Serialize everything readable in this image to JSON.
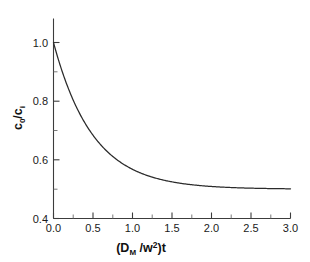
{
  "chart_data": {
    "type": "line",
    "title": "",
    "subtitle": "",
    "xlabel": "(D_M /w^2)t",
    "xlabel_parts": {
      "open_paren": "(D",
      "sub": "M",
      "mid": " /w",
      "sup": "2",
      "close": ")t"
    },
    "ylabel": "c_0/c_i",
    "ylabel_parts": {
      "numerator": "c",
      "numerator_sub": "0",
      "slash": "/c",
      "denominator_sub": "i"
    },
    "xlim": [
      0.0,
      3.0
    ],
    "ylim": [
      0.4,
      1.0
    ],
    "xticks": [
      "0.0",
      "0.5",
      "1.0",
      "1.5",
      "2.0",
      "2.5",
      "3.0"
    ],
    "xtick_values": [
      0.0,
      0.5,
      1.0,
      1.5,
      2.0,
      2.5,
      3.0
    ],
    "xticks_minor": [
      0.25,
      0.75,
      1.25,
      1.75,
      2.25,
      2.75
    ],
    "yticks": [
      "0.4",
      "0.6",
      "0.8",
      "1.0"
    ],
    "ytick_values": [
      0.4,
      0.6,
      0.8,
      1.0
    ],
    "yticks_minor": [
      0.5,
      0.7,
      0.9
    ],
    "grid": false,
    "legend": null,
    "legend_position": "none",
    "series": [
      {
        "name": "c0/ci decay",
        "color": "#2b2b2b",
        "x": [
          0.0,
          0.05,
          0.1,
          0.15,
          0.2,
          0.25,
          0.3,
          0.35,
          0.4,
          0.45,
          0.5,
          0.6,
          0.7,
          0.8,
          0.9,
          1.0,
          1.1,
          1.2,
          1.3,
          1.4,
          1.5,
          1.6,
          1.7,
          1.8,
          1.9,
          2.0,
          2.2,
          2.4,
          2.6,
          2.8,
          3.0
        ],
        "y": [
          1.0,
          0.952,
          0.909,
          0.87,
          0.835,
          0.803,
          0.774,
          0.748,
          0.725,
          0.703,
          0.684,
          0.651,
          0.623,
          0.601,
          0.583,
          0.568,
          0.555,
          0.545,
          0.537,
          0.53,
          0.525,
          0.52,
          0.517,
          0.514,
          0.511,
          0.509,
          0.506,
          0.504,
          0.503,
          0.502,
          0.501
        ]
      }
    ],
    "asymptote": 0.5
  },
  "figure": {
    "background": "#ffffff",
    "axis_color": "#3c3c3c",
    "curve_color": "#2b2b2b"
  }
}
